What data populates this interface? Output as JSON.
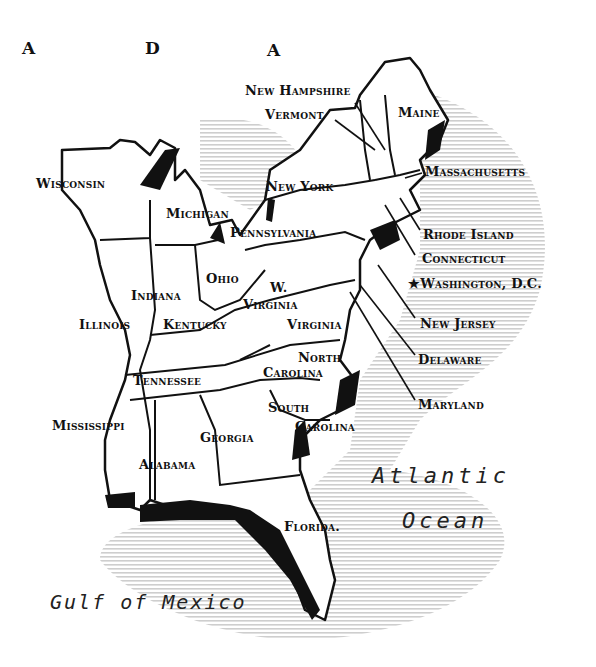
{
  "map": {
    "top_letters": [
      "A",
      "D",
      "A"
    ],
    "states": [
      {
        "id": "new-hampshire",
        "label": "New Hampshire"
      },
      {
        "id": "vermont",
        "label": "Vermont"
      },
      {
        "id": "maine",
        "label": "Maine"
      },
      {
        "id": "wisconsin",
        "label": "Wisconsin"
      },
      {
        "id": "new-york",
        "label": "New York"
      },
      {
        "id": "massachusetts",
        "label": "Massachusetts"
      },
      {
        "id": "michigan",
        "label": "Michigan"
      },
      {
        "id": "pennsylvania",
        "label": "Pennsylvania"
      },
      {
        "id": "rhode-island",
        "label": "Rhode Island"
      },
      {
        "id": "connecticut",
        "label": "Connecticut"
      },
      {
        "id": "ohio",
        "label": "Ohio"
      },
      {
        "id": "west-virginia-1",
        "label": "W."
      },
      {
        "id": "west-virginia-2",
        "label": "Virginia"
      },
      {
        "id": "indiana",
        "label": "Indiana"
      },
      {
        "id": "illinois",
        "label": "Illinois"
      },
      {
        "id": "kentucky",
        "label": "Kentucky"
      },
      {
        "id": "virginia",
        "label": "Virginia"
      },
      {
        "id": "new-jersey",
        "label": "New Jersey"
      },
      {
        "id": "north-carolina-1",
        "label": "North"
      },
      {
        "id": "north-carolina-2",
        "label": "Carolina"
      },
      {
        "id": "delaware",
        "label": "Delaware"
      },
      {
        "id": "tennessee",
        "label": "Tennessee"
      },
      {
        "id": "maryland",
        "label": "Maryland"
      },
      {
        "id": "south-carolina-1",
        "label": "South"
      },
      {
        "id": "south-carolina-2",
        "label": "Carolina"
      },
      {
        "id": "mississippi",
        "label": "Mississippi"
      },
      {
        "id": "georgia",
        "label": "Georgia"
      },
      {
        "id": "alabama",
        "label": "Alabama"
      },
      {
        "id": "florida",
        "label": "Florida."
      }
    ],
    "capital": {
      "symbol": "★",
      "label": "Washington, D.C."
    },
    "water": {
      "atlantic_1": "Atlantic",
      "atlantic_2": "Ocean",
      "gulf": "Gulf of Mexico"
    },
    "colors": {
      "ink": "#111111",
      "shade": "#c8c8c8",
      "land": "#ffffff"
    }
  }
}
